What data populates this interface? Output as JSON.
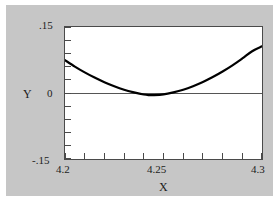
{
  "figure": {
    "background_color": "#c6c6c6",
    "plot_background_color": "#ffffff",
    "frame_color": "#4a4a4a",
    "curve_color": "#000000",
    "zero_line_color": "#555555"
  },
  "axes": {
    "y_title": "Y",
    "x_title": "X",
    "y_tick_labels": {
      "top": ".15",
      "zero": "0",
      "bottom": "-.15"
    },
    "x_tick_labels": {
      "left": "4.2",
      "mid": "4.25",
      "right": "4.3"
    }
  },
  "chart_data": {
    "type": "line",
    "title": "",
    "subtitle": "",
    "xlabel": "X",
    "ylabel": "Y",
    "xlim": [
      4.2,
      4.3
    ],
    "ylim": [
      -0.15,
      0.15
    ],
    "xticks": [
      4.2,
      4.21,
      4.22,
      4.23,
      4.24,
      4.25,
      4.26,
      4.27,
      4.28,
      4.29,
      4.3
    ],
    "xticklabels": [
      "4.2",
      "",
      "",
      "",
      "",
      "4.25",
      "",
      "",
      "",
      "",
      "4.3"
    ],
    "yticks": [
      -0.15,
      -0.12,
      -0.09,
      -0.06,
      -0.03,
      0,
      0.03,
      0.06,
      0.09,
      0.12,
      0.15
    ],
    "yticklabels": [
      "-.15",
      "",
      "",
      "",
      "",
      "0",
      "",
      "",
      "",
      "",
      ".15"
    ],
    "grid": false,
    "legend": null,
    "annotations": [
      {
        "text": "zero reference line",
        "y": 0
      }
    ],
    "series": [
      {
        "name": "curve",
        "x": [
          4.2,
          4.205,
          4.21,
          4.215,
          4.22,
          4.225,
          4.23,
          4.235,
          4.24,
          4.2425,
          4.245,
          4.25,
          4.255,
          4.26,
          4.265,
          4.27,
          4.275,
          4.28,
          4.285,
          4.29,
          4.295,
          4.3
        ],
        "y": [
          0.0745,
          0.06,
          0.0468,
          0.035,
          0.0245,
          0.0153,
          0.0075,
          0.0015,
          -0.0035,
          -0.0048,
          -0.0048,
          -0.003,
          0.0015,
          0.0075,
          0.0155,
          0.025,
          0.0362,
          0.0488,
          0.0628,
          0.0785,
          0.095,
          0.106
        ]
      },
      {
        "name": "zero-line",
        "x": [
          4.2,
          4.3
        ],
        "y": [
          0,
          0
        ]
      }
    ]
  }
}
